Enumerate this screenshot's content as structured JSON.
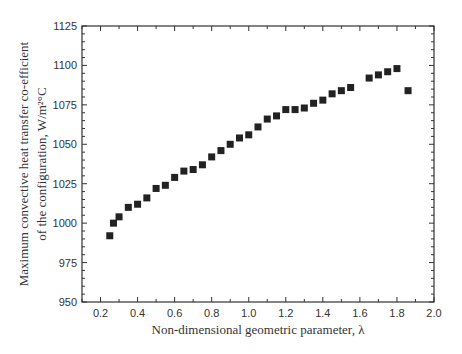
{
  "chart_data": {
    "type": "scatter",
    "title": "",
    "xlabel": "Non-dimensional geometric parameter, λ",
    "ylabel_line1": "Maximum convective heat transfer co-efficient",
    "ylabel_line2": "of the configuration, W/m²°C",
    "xlim": [
      0.1,
      2.0
    ],
    "ylim": [
      950,
      1125
    ],
    "x_ticks": [
      0.2,
      0.4,
      0.6,
      0.8,
      1.0,
      1.2,
      1.4,
      1.6,
      1.8,
      2.0
    ],
    "x_tick_labels": [
      "0.2",
      "0.4",
      "0.6",
      "0.8",
      "1.0",
      "1.2",
      "1.4",
      "1.6",
      "1.8",
      "2.0"
    ],
    "y_ticks": [
      950,
      975,
      1000,
      1025,
      1050,
      1075,
      1100,
      1125
    ],
    "y_tick_labels": [
      "950",
      "975",
      "1000",
      "1025",
      "1050",
      "1075",
      "1100",
      "1125"
    ],
    "grid": false,
    "legend": null,
    "marker": "filled-square",
    "marker_color": "#222222",
    "series": [
      {
        "name": "h_max",
        "x": [
          0.25,
          0.27,
          0.3,
          0.35,
          0.4,
          0.45,
          0.5,
          0.55,
          0.6,
          0.65,
          0.7,
          0.75,
          0.8,
          0.85,
          0.9,
          0.95,
          1.0,
          1.05,
          1.1,
          1.15,
          1.2,
          1.25,
          1.3,
          1.35,
          1.4,
          1.45,
          1.5,
          1.55,
          1.65,
          1.7,
          1.75,
          1.8,
          1.86
        ],
        "y": [
          992,
          1000,
          1004,
          1010,
          1012,
          1016,
          1022,
          1024,
          1029,
          1033,
          1034,
          1037,
          1042,
          1046,
          1050,
          1054,
          1056,
          1061,
          1066,
          1068,
          1072,
          1072,
          1073,
          1076,
          1078,
          1082,
          1084,
          1086,
          1092,
          1094,
          1096,
          1098,
          1084
        ]
      }
    ]
  }
}
